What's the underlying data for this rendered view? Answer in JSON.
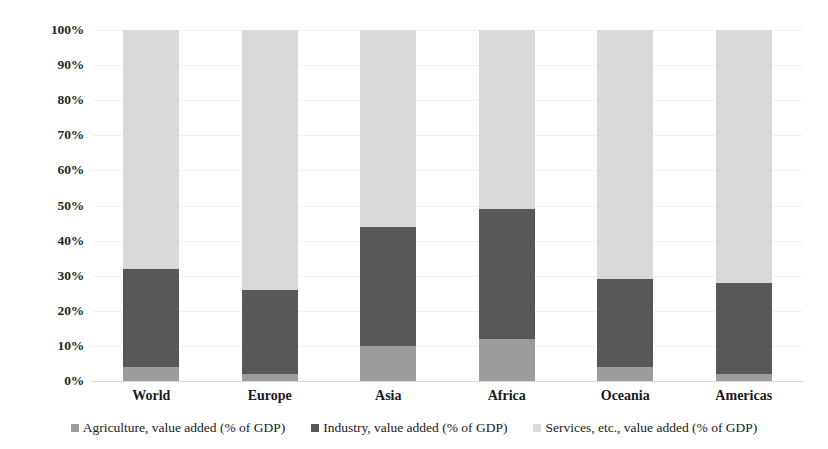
{
  "chart_data": {
    "type": "bar",
    "subtype": "stacked-percentage-column",
    "title": "",
    "xlabel": "",
    "ylabel": "",
    "ylim": [
      0,
      100
    ],
    "grid": true,
    "legend_position": "bottom",
    "categories": [
      "World",
      "Europe",
      "Asia",
      "Africa",
      "Oceania",
      "Americas"
    ],
    "ytick_labels": [
      "100%",
      "90%",
      "80%",
      "70%",
      "60%",
      "50%",
      "40%",
      "30%",
      "20%",
      "10%",
      "0%"
    ],
    "ytick_values": [
      100,
      90,
      80,
      70,
      60,
      50,
      40,
      30,
      20,
      10,
      0
    ],
    "series": [
      {
        "name": "Agriculture, value added (% of GDP)",
        "color": "#9c9c9c",
        "values": [
          4,
          2,
          10,
          12,
          4,
          2
        ]
      },
      {
        "name": "Industry, value added (% of GDP)",
        "color": "#585858",
        "values": [
          28,
          24,
          34,
          37,
          25,
          26
        ]
      },
      {
        "name": "Services, etc., value added (% of GDP)",
        "color": "#d9d9d9",
        "values": [
          68,
          74,
          56,
          51,
          71,
          72
        ]
      }
    ]
  },
  "legend": {
    "items": [
      {
        "label": "Agriculture, value added (% of GDP)",
        "color": "#9c9c9c"
      },
      {
        "label": "Industry, value added (% of GDP)",
        "color": "#585858"
      },
      {
        "label": "Services, etc., value added (% of GDP)",
        "color": "#d9d9d9"
      }
    ]
  },
  "colors": {
    "agriculture": "#9c9c9c",
    "industry": "#585858",
    "services": "#d9d9d9",
    "gridline": "#f2f2f2",
    "baseline": "#d9d9d9",
    "text": "#1a1a1a",
    "background": "#ffffff"
  }
}
